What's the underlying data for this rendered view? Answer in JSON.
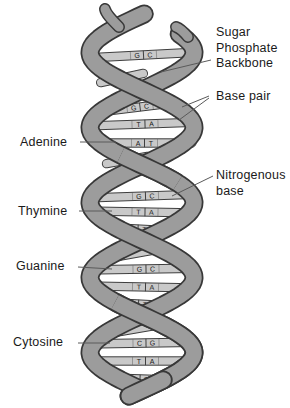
{
  "labels": {
    "sugar_phosphate_backbone": "Sugar\nPhosphate\nBackbone",
    "base_pair": "Base pair",
    "adenine": "Adenine",
    "nitrogenous_base": "Nitrogenous\nbase",
    "thymine": "Thymine",
    "guanine": "Guanine",
    "cytosine": "Cytosine"
  },
  "rungs": [
    {
      "pair": "G|C"
    },
    {
      "pair": ""
    },
    {
      "pair": "G|C"
    },
    {
      "pair": "T|A"
    },
    {
      "pair": "A|T"
    },
    {
      "pair": ""
    },
    {
      "pair": "G|C"
    },
    {
      "pair": "T|A"
    },
    {
      "pair": "A|T"
    },
    {
      "pair": ""
    },
    {
      "pair": "G|C"
    },
    {
      "pair": "T|A"
    },
    {
      "pair": "A|T"
    },
    {
      "pair": ""
    },
    {
      "pair": "C|G"
    },
    {
      "pair": "T|A"
    },
    {
      "pair": "A|T"
    }
  ],
  "colors": {
    "background": "#ffffff",
    "strand_fill": "#9c9c9c",
    "strand_outline": "#383838",
    "rung_fill": "#c9c9c9",
    "rung_outline": "#3f3f3f",
    "base_letter": "#1c1c1c",
    "label_text": "#1a1a1a",
    "leader_line": "#5a5a5a"
  }
}
